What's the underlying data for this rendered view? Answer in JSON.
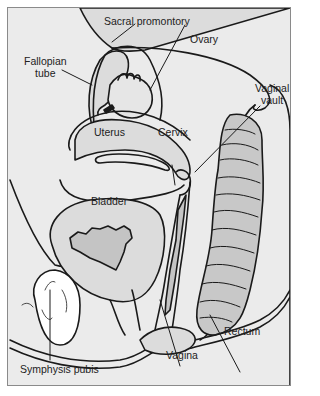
{
  "diagram": {
    "type": "anatomical sagittal section",
    "colors": {
      "background": "#ebebeb",
      "organ_fill": "#dcdcdc",
      "organ_dark": "#c4c4c4",
      "bone_fill": "#ffffff",
      "line": "#1a1a1a",
      "border": "#8a8a8a"
    },
    "labels": {
      "sacral_promontory": "Sacral promontory",
      "fallopian_tube": "Fallopian\ntube",
      "ovary": "Ovary",
      "vaginal_vault": "Vaginal\nvault",
      "uterus": "Uterus",
      "cervix": "Cervix",
      "bladder": "Bladder",
      "rectum": "Rectum",
      "vagina": "Vagina",
      "symphysis_pubis": "Symphysis pubis"
    }
  }
}
